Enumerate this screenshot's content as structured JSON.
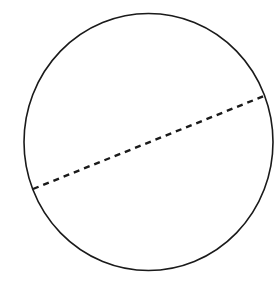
{
  "diagram": {
    "background": "#ffffff",
    "stroke_color": "#1a1a1a",
    "circle": {
      "cx": 148.5,
      "cy": 142,
      "rx": 124.5,
      "ry": 128.5,
      "stroke_width": 1.6
    },
    "diameter": {
      "x1": 33,
      "y1": 189,
      "x2": 264,
      "y2": 96,
      "stroke_width": 2.4,
      "dash": "6 5"
    }
  }
}
